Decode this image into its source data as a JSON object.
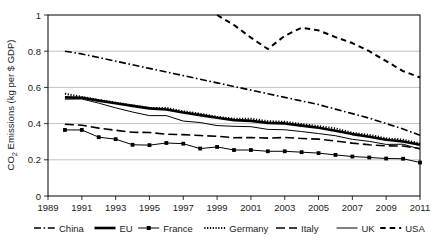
{
  "chart_data": {
    "type": "line",
    "title": "",
    "xlabel": "",
    "ylabel": "CO2 Emissions (kg per $ GDP)",
    "ylabel_parts": {
      "pre": "CO",
      "sub": "2",
      "post": " Emissions (kg per $ GDP)"
    },
    "xlim": [
      1989,
      2011
    ],
    "ylim": [
      0,
      1
    ],
    "yticks": [
      0,
      0.2,
      0.4,
      0.6,
      0.8,
      1
    ],
    "ytick_labels": [
      "0",
      "0.2",
      "0.4",
      "0.6",
      "0.8",
      "1"
    ],
    "xticks": [
      1989,
      1991,
      1993,
      1995,
      1997,
      1999,
      2001,
      2003,
      2005,
      2007,
      2009,
      2011
    ],
    "xtick_labels": [
      "1989",
      "1991",
      "1993",
      "1995",
      "1997",
      "1999",
      "2001",
      "2003",
      "2005",
      "2007",
      "2009",
      "2011"
    ],
    "grid": "horizontal",
    "legend_position": "bottom",
    "line_color": "#000000",
    "series": [
      {
        "name": "China",
        "style": "dash-dot",
        "marker": "none",
        "x": [
          1990,
          1991,
          1992,
          1993,
          1994,
          1995,
          1996,
          1997,
          1998,
          1999,
          2000,
          2001,
          2002,
          2003,
          2004,
          2005,
          2006,
          2007,
          2008,
          2009,
          2010,
          2011
        ],
        "values": [
          0.8,
          0.785,
          0.765,
          0.745,
          0.725,
          0.705,
          0.685,
          0.665,
          0.645,
          0.625,
          0.605,
          0.585,
          0.565,
          0.545,
          0.525,
          0.505,
          0.48,
          0.455,
          0.43,
          0.4,
          0.37,
          0.335
        ]
      },
      {
        "name": "EU",
        "style": "solid-thick",
        "marker": "none",
        "x": [
          1990,
          1991,
          1992,
          1993,
          1994,
          1995,
          1996,
          1997,
          1998,
          1999,
          2000,
          2001,
          2002,
          2003,
          2004,
          2005,
          2006,
          2007,
          2008,
          2009,
          2010,
          2011
        ],
        "values": [
          0.545,
          0.543,
          0.527,
          0.512,
          0.498,
          0.484,
          0.478,
          0.461,
          0.447,
          0.432,
          0.419,
          0.415,
          0.404,
          0.401,
          0.389,
          0.377,
          0.361,
          0.342,
          0.327,
          0.311,
          0.301,
          0.283
        ]
      },
      {
        "name": "France",
        "style": "solid-thin",
        "marker": "square",
        "x": [
          1990,
          1991,
          1992,
          1993,
          1994,
          1995,
          1996,
          1997,
          1998,
          1999,
          2000,
          2001,
          2002,
          2003,
          2004,
          2005,
          2006,
          2007,
          2008,
          2009,
          2010,
          2011
        ],
        "values": [
          0.365,
          0.365,
          0.325,
          0.314,
          0.283,
          0.281,
          0.293,
          0.289,
          0.262,
          0.271,
          0.254,
          0.254,
          0.247,
          0.247,
          0.242,
          0.237,
          0.227,
          0.218,
          0.213,
          0.207,
          0.206,
          0.185
        ]
      },
      {
        "name": "Germany",
        "style": "dotted",
        "marker": "none",
        "x": [
          1990,
          1991,
          1992,
          1993,
          1994,
          1995,
          1996,
          1997,
          1998,
          1999,
          2000,
          2001,
          2002,
          2003,
          2004,
          2005,
          2006,
          2007,
          2008,
          2009,
          2010,
          2011
        ],
        "values": [
          0.565,
          0.548,
          0.531,
          0.516,
          0.501,
          0.487,
          0.487,
          0.468,
          0.455,
          0.438,
          0.427,
          0.427,
          0.414,
          0.41,
          0.398,
          0.386,
          0.374,
          0.349,
          0.338,
          0.319,
          0.311,
          0.291
        ]
      },
      {
        "name": "Italy",
        "style": "long-dash",
        "marker": "none",
        "x": [
          1990,
          1991,
          1992,
          1993,
          1994,
          1995,
          1996,
          1997,
          1998,
          1999,
          2000,
          2001,
          2002,
          2003,
          2004,
          2005,
          2006,
          2007,
          2008,
          2009,
          2010,
          2011
        ],
        "values": [
          0.396,
          0.391,
          0.375,
          0.363,
          0.352,
          0.351,
          0.341,
          0.339,
          0.334,
          0.33,
          0.322,
          0.323,
          0.32,
          0.323,
          0.318,
          0.314,
          0.304,
          0.292,
          0.283,
          0.277,
          0.276,
          0.262
        ]
      },
      {
        "name": "UK",
        "style": "solid-thin",
        "marker": "none",
        "x": [
          1990,
          1991,
          1992,
          1993,
          1994,
          1995,
          1996,
          1997,
          1998,
          1999,
          2000,
          2001,
          2002,
          2003,
          2004,
          2005,
          2006,
          2007,
          2008,
          2009,
          2010,
          2011
        ],
        "values": [
          0.535,
          0.536,
          0.513,
          0.487,
          0.464,
          0.444,
          0.444,
          0.414,
          0.406,
          0.389,
          0.385,
          0.383,
          0.368,
          0.366,
          0.356,
          0.345,
          0.333,
          0.313,
          0.302,
          0.285,
          0.286,
          0.259
        ]
      },
      {
        "name": "USA",
        "style": "short-dash",
        "marker": "none",
        "x": [
          1999,
          2000,
          2001,
          2002,
          2003,
          2004,
          2005,
          2006,
          2007,
          2008,
          2009,
          2010,
          2011
        ],
        "values": [
          1.0,
          0.945,
          0.875,
          0.812,
          0.885,
          0.93,
          0.915,
          0.878,
          0.845,
          0.8,
          0.745,
          0.69,
          0.655
        ]
      }
    ]
  },
  "legend": {
    "items": [
      {
        "label": "China",
        "style": "dash-dot"
      },
      {
        "label": "EU",
        "style": "solid-thick"
      },
      {
        "label": "France",
        "style": "solid-marker"
      },
      {
        "label": "Germany",
        "style": "dotted"
      },
      {
        "label": "Italy",
        "style": "long-dash"
      },
      {
        "label": "UK",
        "style": "solid-thin"
      },
      {
        "label": "USA",
        "style": "short-dash"
      }
    ]
  }
}
